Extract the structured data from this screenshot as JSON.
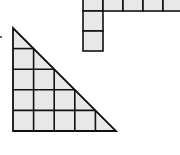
{
  "diagram": {
    "colors": {
      "fill": "#e8e8e8",
      "stroke": "#111111",
      "background": "#ffffff"
    },
    "triangle": {
      "rows": 5,
      "cols": 5,
      "cell_size": 20.6,
      "origin_x": 13,
      "origin_y": 28,
      "hypotenuse": "from top-left to bottom-right"
    },
    "l_shape": {
      "vertical_cells": 3,
      "horizontal_cells": 4,
      "cell_size": 20,
      "column_x": 83,
      "top_row_y": -9
    },
    "marker": {
      "x": 1,
      "y": 37
    }
  }
}
